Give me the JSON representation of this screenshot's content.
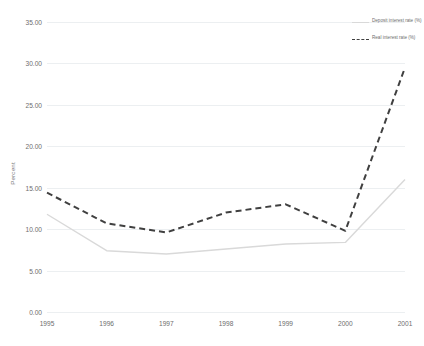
{
  "chart_data": {
    "type": "line",
    "title": "",
    "xlabel": "",
    "ylabel": "Percent",
    "categories": [
      "1995",
      "1996",
      "1997",
      "1998",
      "1999",
      "2000",
      "2001"
    ],
    "ylim": [
      0,
      35
    ],
    "ytick_interval": 5,
    "ytick_labels": [
      "0.00",
      "5.00",
      "10.00",
      "15.00",
      "20.00",
      "25.00",
      "30.00",
      "35.00"
    ],
    "ytick_values": [
      0,
      5,
      10,
      15,
      20,
      25,
      30,
      35
    ],
    "grid": true,
    "legend_position": "top-right",
    "series": [
      {
        "name": "Deposit interest rate (%)",
        "style": "solid",
        "color": "#d9d9d9",
        "values": [
          11.8,
          7.4,
          7.0,
          7.6,
          8.2,
          8.4,
          16.0
        ]
      },
      {
        "name": "Real interest rate (%)",
        "style": "dashed",
        "color": "#404040",
        "values": [
          14.4,
          10.7,
          9.6,
          12.0,
          13.0,
          9.8,
          29.5
        ]
      }
    ]
  },
  "legend": {
    "entries": [
      {
        "label": "Deposit interest rate (%)"
      },
      {
        "label": "Real interest rate (%)"
      }
    ]
  }
}
